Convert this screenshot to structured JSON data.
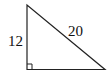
{
  "diagram": {
    "type": "right-triangle",
    "leg_vertical_label": "12",
    "hypotenuse_label": "20",
    "right_angle_marker": "bottom-left",
    "stroke_color": "#222222"
  }
}
